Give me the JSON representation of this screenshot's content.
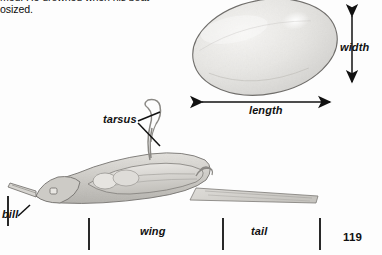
{
  "page": {
    "number": "119",
    "background_color": "#fdfdfd",
    "ink_color": "#111111"
  },
  "body_text": {
    "content": "naturalist after whom a bunting is\nnamed. He drowned when his boat\ncapsized.",
    "visible_fragment": "med. He drowned when his boat\nosized.",
    "note_first_line_clipped": "naturalist after whom a bunting is"
  },
  "egg_diagram": {
    "name": "egg-specimen",
    "shape": "tilted-ellipse",
    "fill_color": "#e9e8e6",
    "outline_color": "#6a6a68",
    "bounds": {
      "x": 192,
      "y": 1,
      "width": 146,
      "height": 92
    },
    "rotation_deg": -12,
    "measurements": [
      {
        "label": "length",
        "orientation": "horizontal",
        "arrow_from": {
          "x": 194,
          "y": 102
        },
        "arrow_to": {
          "x": 338,
          "y": 102
        },
        "double_headed": true
      },
      {
        "label": "width",
        "orientation": "vertical",
        "arrow_from": {
          "x": 352,
          "y": 8
        },
        "arrow_to": {
          "x": 352,
          "y": 90
        },
        "double_headed": true
      }
    ]
  },
  "bird_diagram": {
    "name": "bird-specimen-lateral",
    "fill_color": "#d9d7d3",
    "outline_color": "#6f6d6a",
    "callouts": [
      {
        "label": "tarsus",
        "label_position": {
          "x": 103,
          "y": 113
        },
        "leader_lines": 2,
        "points_to": "leg"
      },
      {
        "label": "bill",
        "label_position": {
          "x": 2,
          "y": 208
        },
        "leader_lines": 1,
        "points_to": "beak"
      }
    ],
    "span_measurements": [
      {
        "label": "wing",
        "tick_left_x": 89,
        "tick_right_x": 223,
        "label_x": 140
      },
      {
        "label": "tail",
        "tick_left_x": 223,
        "tick_right_x": 320,
        "label_x": 251
      }
    ],
    "tick_marks": [
      {
        "x": 8,
        "y_top": 196,
        "y_bottom": 226
      },
      {
        "x": 89,
        "y_top": 218,
        "y_bottom": 250
      },
      {
        "x": 223,
        "y_top": 218,
        "y_bottom": 250
      },
      {
        "x": 320,
        "y_top": 218,
        "y_bottom": 250
      }
    ]
  },
  "labels": {
    "width": "width",
    "length": "length",
    "tarsus": "tarsus",
    "bill": "bill",
    "wing": "wing",
    "tail": "tail"
  }
}
